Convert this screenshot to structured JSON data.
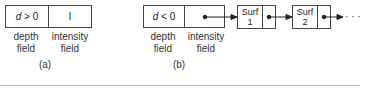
{
  "panel_a": {
    "depth_value": "d > 0",
    "intensity_value": "I",
    "depth_label_1": "depth",
    "depth_label_2": "field",
    "intensity_label_1": "intensity",
    "intensity_label_2": "field",
    "caption": "(a)"
  },
  "panel_b": {
    "depth_value": "d < 0",
    "depth_label_1": "depth",
    "depth_label_2": "field",
    "intensity_label_1": "intensity",
    "intensity_label_2": "field",
    "caption": "(b)",
    "nodes": [
      {
        "line1": "Surf",
        "line2": "1"
      },
      {
        "line1": "Surf",
        "line2": "2"
      }
    ],
    "ellipsis": "· · ·"
  }
}
